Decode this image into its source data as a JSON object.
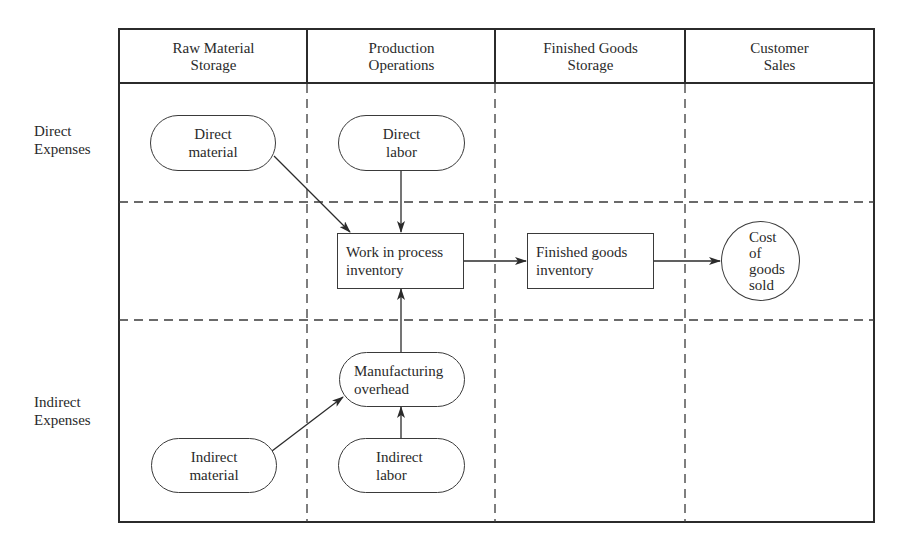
{
  "diagram": {
    "columns": [
      {
        "line1": "Raw Material",
        "line2": "Storage"
      },
      {
        "line1": "Production",
        "line2": "Operations"
      },
      {
        "line1": "Finished Goods",
        "line2": "Storage"
      },
      {
        "line1": "Customer",
        "line2": "Sales"
      }
    ],
    "rows": [
      {
        "line1": "Direct",
        "line2": "Expenses"
      },
      {
        "line1": "Indirect",
        "line2": "Expenses"
      }
    ],
    "nodes": {
      "direct_material": {
        "line1": "Direct",
        "line2": "material",
        "shape": "rounded"
      },
      "direct_labor": {
        "line1": "Direct",
        "line2": "labor",
        "shape": "rounded"
      },
      "work_in_process": {
        "line1": "Work in process",
        "line2": "inventory",
        "shape": "rectangle"
      },
      "finished_goods": {
        "line1": "Finished goods",
        "line2": "inventory",
        "shape": "rectangle"
      },
      "cost_of_goods_sold": {
        "line1": "Cost",
        "line2": "of",
        "line3": "goods",
        "line4": "sold",
        "shape": "circle"
      },
      "manufacturing_overhead": {
        "line1": "Manufacturing",
        "line2": "overhead",
        "shape": "rounded"
      },
      "indirect_material": {
        "line1": "Indirect",
        "line2": "material",
        "shape": "rounded"
      },
      "indirect_labor": {
        "line1": "Indirect",
        "line2": "labor",
        "shape": "rounded"
      }
    },
    "edges": [
      {
        "from": "Direct material",
        "to": "Work in process inventory"
      },
      {
        "from": "Direct labor",
        "to": "Work in process inventory"
      },
      {
        "from": "Manufacturing overhead",
        "to": "Work in process inventory"
      },
      {
        "from": "Indirect material",
        "to": "Manufacturing overhead"
      },
      {
        "from": "Indirect labor",
        "to": "Manufacturing overhead"
      },
      {
        "from": "Work in process inventory",
        "to": "Finished goods inventory"
      },
      {
        "from": "Finished goods inventory",
        "to": "Cost of goods sold"
      }
    ],
    "colors": {
      "ink": "#2b2b2b",
      "background": "#ffffff"
    }
  }
}
